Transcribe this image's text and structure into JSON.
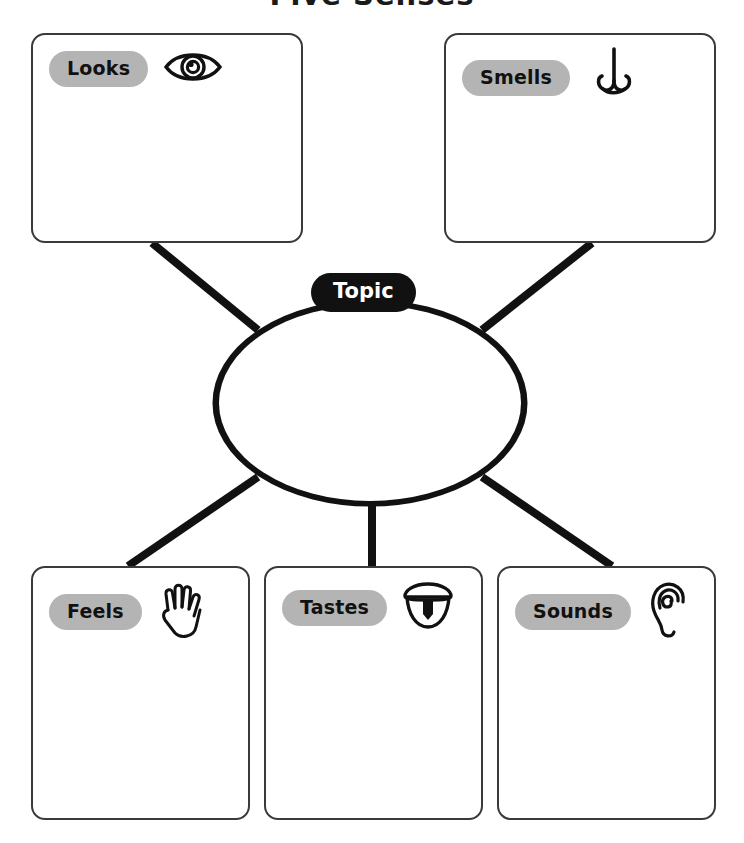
{
  "page": {
    "title": "Five Senses",
    "title_cropped": true,
    "background_color": "#ffffff"
  },
  "colors": {
    "ink": "#111111",
    "box_border": "#3a3a3a",
    "pill_grey": "#b4b4b4",
    "topic_pill": "#111111",
    "topic_text": "#ffffff",
    "connector": "#111111"
  },
  "center": {
    "label": "Topic",
    "shape": "oval",
    "write_area_placeholder": ""
  },
  "boxes": [
    {
      "id": "looks",
      "label": "Looks",
      "icon": "eye-icon",
      "position": "top-left",
      "write_area_placeholder": ""
    },
    {
      "id": "smells",
      "label": "Smells",
      "icon": "nose-icon",
      "position": "top-right",
      "write_area_placeholder": ""
    },
    {
      "id": "feels",
      "label": "Feels",
      "icon": "hand-icon",
      "position": "bottom-left",
      "write_area_placeholder": ""
    },
    {
      "id": "tastes",
      "label": "Tastes",
      "icon": "mouth-tongue-icon",
      "position": "bottom-center",
      "write_area_placeholder": ""
    },
    {
      "id": "sounds",
      "label": "Sounds",
      "icon": "ear-icon",
      "position": "bottom-right",
      "write_area_placeholder": ""
    }
  ]
}
